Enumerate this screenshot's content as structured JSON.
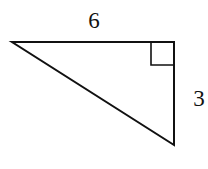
{
  "diagram": {
    "type": "right-triangle",
    "labels": {
      "top_side": "6",
      "right_side": "3"
    },
    "right_angle_marker": true,
    "stroke_color": "#111111",
    "background": "#ffffff"
  }
}
